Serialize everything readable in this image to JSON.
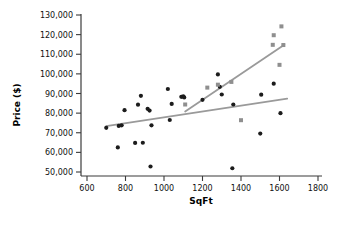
{
  "chart_data": {
    "type": "scatter",
    "title": "",
    "xlabel": "SqFt",
    "ylabel": "Price ($)",
    "xlim": [
      600,
      1800
    ],
    "ylim": [
      50000,
      130000
    ],
    "xticks": [
      600,
      800,
      1000,
      1200,
      1400,
      1600,
      1800
    ],
    "xtick_labels": [
      "600",
      "800",
      "1000",
      "1200",
      "1400",
      "1600",
      "1800"
    ],
    "yticks": [
      50000,
      60000,
      70000,
      80000,
      90000,
      100000,
      110000,
      120000,
      130000
    ],
    "ytick_labels": [
      "50,000",
      "60,000",
      "70,000",
      "80,000",
      "90,000",
      "100,000",
      "110,000",
      "120,000",
      "130,000"
    ],
    "grid": false,
    "legend": null,
    "series": [
      {
        "name": "circles",
        "marker": "circle",
        "color": "#1c1c1c",
        "points": [
          [
            700,
            72500
          ],
          [
            760,
            62500
          ],
          [
            765,
            73500
          ],
          [
            780,
            73800
          ],
          [
            795,
            81500
          ],
          [
            850,
            64800
          ],
          [
            865,
            84300
          ],
          [
            880,
            88800
          ],
          [
            890,
            64900
          ],
          [
            915,
            82200
          ],
          [
            925,
            81300
          ],
          [
            930,
            52800
          ],
          [
            935,
            73800
          ],
          [
            1020,
            92300
          ],
          [
            1030,
            76500
          ],
          [
            1040,
            84700
          ],
          [
            1090,
            88300
          ],
          [
            1100,
            88500
          ],
          [
            1105,
            88000
          ],
          [
            1200,
            86800
          ],
          [
            1280,
            99700
          ],
          [
            1290,
            93400
          ],
          [
            1300,
            89500
          ],
          [
            1355,
            51900
          ],
          [
            1360,
            84400
          ],
          [
            1500,
            69600
          ],
          [
            1505,
            89400
          ],
          [
            1570,
            95000
          ],
          [
            1605,
            80000
          ]
        ]
      },
      {
        "name": "squares",
        "marker": "square",
        "color": "#8f8f8f",
        "points": [
          [
            1110,
            84400
          ],
          [
            1225,
            93000
          ],
          [
            1280,
            94500
          ],
          [
            1350,
            95900
          ],
          [
            1400,
            76400
          ],
          [
            1565,
            114800
          ],
          [
            1570,
            119700
          ],
          [
            1600,
            104600
          ],
          [
            1610,
            124200
          ],
          [
            1620,
            114700
          ]
        ]
      }
    ],
    "trend_lines": [
      {
        "name": "shallow-trend",
        "color": "#9a9a9a",
        "x0": 700,
        "y0": 73400,
        "x1": 1640,
        "y1": 87400
      },
      {
        "name": "steep-trend",
        "color": "#9a9a9a",
        "x0": 1110,
        "y0": 80800,
        "x1": 1625,
        "y1": 114800
      }
    ]
  }
}
